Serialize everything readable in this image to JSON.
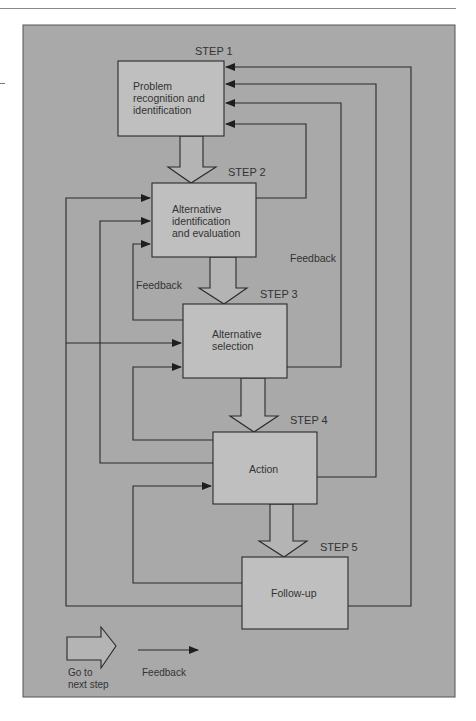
{
  "diagram": {
    "colors": {
      "panel": "#a9a9a9",
      "box": "#bfbfbf",
      "line": "#2a2a2a",
      "text": "#333333"
    },
    "steps": [
      {
        "step_label": "STEP 1",
        "lines": [
          "Problem",
          "recognition and",
          "identification"
        ]
      },
      {
        "step_label": "STEP 2",
        "lines": [
          "Alternative",
          "identification",
          "and evaluation"
        ]
      },
      {
        "step_label": "STEP 3",
        "lines": [
          "Alternative",
          "selection"
        ]
      },
      {
        "step_label": "STEP 4",
        "lines": [
          "Action"
        ]
      },
      {
        "step_label": "STEP 5",
        "lines": [
          "Follow-up"
        ]
      }
    ],
    "feedback_labels": [
      "Feedback",
      "Feedback"
    ],
    "legend": {
      "go_next_line1": "Go to",
      "go_next_line2": "next step",
      "feedback": "Feedback"
    }
  }
}
